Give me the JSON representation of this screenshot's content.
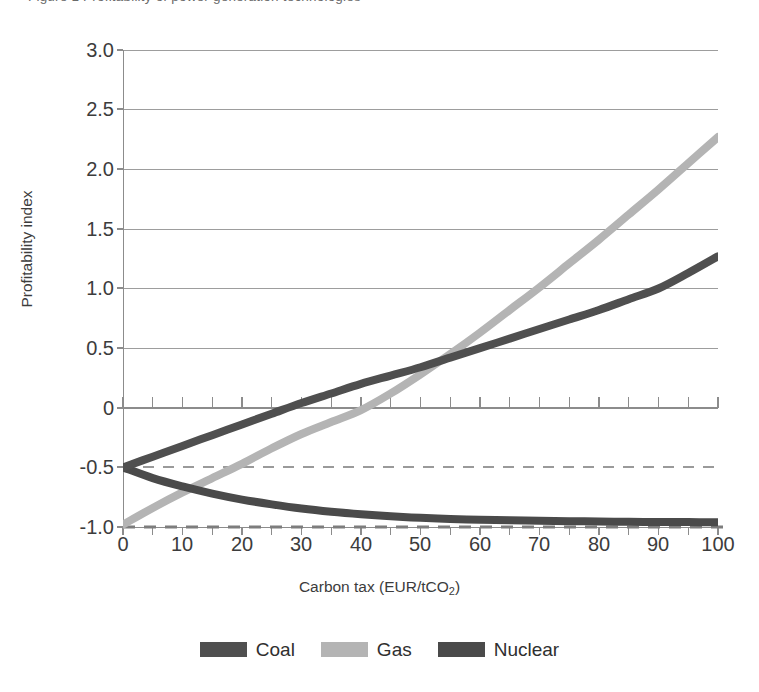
{
  "top_caption": "Figure 1  Profitability of power generation technologies",
  "chart_data": {
    "type": "line",
    "title": "",
    "xlabel": "Carbon tax (EUR/tCO₂)",
    "xlabel_base": "Carbon tax (EUR/tCO",
    "xlabel_sub": "2",
    "xlabel_tail": ")",
    "ylabel": "Profitability index",
    "xlim": [
      0,
      100
    ],
    "ylim": [
      -1.0,
      3.0
    ],
    "xticks": [
      0,
      10,
      20,
      30,
      40,
      50,
      60,
      70,
      80,
      90,
      100
    ],
    "xtick_labels": [
      "0",
      "10",
      "20",
      "30",
      "40",
      "50",
      "60",
      "70",
      "80",
      "90",
      "100"
    ],
    "minor_xtick_step": 5,
    "yticks": [
      3.0,
      2.5,
      2.0,
      1.5,
      1.0,
      0.5,
      0,
      -0.5,
      -1.0
    ],
    "ytick_labels": [
      "3.0",
      "2.5",
      "2.0",
      "1.5",
      "1.0",
      "0.5",
      "0",
      "-0.5",
      "-1.0"
    ],
    "grid": "horizontal",
    "legend_position": "bottom-center",
    "x": [
      0,
      5,
      10,
      15,
      20,
      25,
      30,
      35,
      40,
      45,
      50,
      55,
      60,
      65,
      70,
      75,
      80,
      85,
      90,
      95,
      100
    ],
    "series": [
      {
        "name": "Coal",
        "color": "#4f4f4f",
        "values": [
          -0.5,
          -0.41,
          -0.32,
          -0.23,
          -0.14,
          -0.05,
          0.04,
          0.12,
          0.2,
          0.27,
          0.34,
          0.42,
          0.5,
          0.58,
          0.66,
          0.74,
          0.82,
          0.91,
          1.0,
          1.13,
          1.27
        ]
      },
      {
        "name": "Gas",
        "color": "#b4b4b4",
        "values": [
          -0.98,
          -0.84,
          -0.71,
          -0.59,
          -0.47,
          -0.34,
          -0.22,
          -0.12,
          -0.02,
          0.12,
          0.28,
          0.45,
          0.63,
          0.82,
          1.01,
          1.21,
          1.41,
          1.62,
          1.83,
          2.05,
          2.27
        ]
      },
      {
        "name": "Nuclear",
        "color": "#4a4a4a",
        "values": [
          -0.5,
          -0.59,
          -0.66,
          -0.72,
          -0.77,
          -0.81,
          -0.845,
          -0.872,
          -0.893,
          -0.91,
          -0.923,
          -0.932,
          -0.939,
          -0.944,
          -0.948,
          -0.951,
          -0.954,
          -0.956,
          -0.958,
          -0.959,
          -0.96
        ]
      }
    ],
    "reference_lines": [
      {
        "name": "dashed-half",
        "y": -0.5,
        "style": "dashed",
        "color": "#9a9a9a"
      },
      {
        "name": "dashed-one",
        "y": -1.0,
        "style": "dashed",
        "color": "#7d7d7d"
      }
    ]
  },
  "legend": {
    "items": [
      {
        "label": "Coal",
        "color": "#4f4f4f"
      },
      {
        "label": "Gas",
        "color": "#b4b4b4"
      },
      {
        "label": "Nuclear",
        "color": "#4a4a4a"
      }
    ]
  },
  "axis_colors": {
    "grid": "#9a9a9a",
    "axis": "#8c8c8c",
    "text": "#3c3c3c"
  }
}
